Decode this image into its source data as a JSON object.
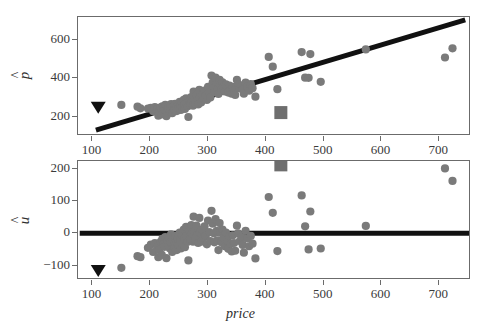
{
  "figure": {
    "width": 481,
    "height": 331,
    "background": "#ffffff",
    "point_color": "#7a7a7a",
    "line_color": "#111111",
    "frame_color": "#6b6b6b",
    "triangle_color": "#111111",
    "square_color": "#6e6e6e"
  },
  "chart_data": [
    {
      "type": "scatter",
      "id": "fitted-vs-price",
      "title": "",
      "xlabel": "price",
      "ylabel": "p̂",
      "xlim": [
        75,
        755
      ],
      "ylim": [
        100,
        720
      ],
      "grid": false,
      "legend": "none",
      "xticks": [
        100,
        200,
        300,
        400,
        500,
        600,
        700
      ],
      "yticks": [
        200,
        400,
        600
      ],
      "xticklabels": [
        "100",
        "200",
        "300",
        "400",
        "500",
        "600",
        "700"
      ],
      "yticklabels": [
        "200",
        "400",
        "600"
      ],
      "series": [
        {
          "name": "fitted values",
          "marker": "circle",
          "color": "#7a7a7a",
          "x": [
            150,
            178,
            183,
            196,
            201,
            205,
            208,
            212,
            214,
            216,
            218,
            220,
            221,
            223,
            225,
            226,
            228,
            229,
            231,
            232,
            234,
            235,
            236,
            238,
            239,
            241,
            242,
            243,
            245,
            246,
            248,
            249,
            251,
            252,
            253,
            255,
            256,
            258,
            259,
            260,
            262,
            263,
            265,
            266,
            268,
            269,
            271,
            272,
            274,
            275,
            277,
            278,
            280,
            281,
            283,
            285,
            286,
            288,
            290,
            292,
            294,
            296,
            298,
            300,
            302,
            304,
            306,
            308,
            310,
            311,
            313,
            315,
            316,
            318,
            320,
            321,
            323,
            325,
            327,
            329,
            331,
            333,
            335,
            337,
            339,
            341,
            343,
            345,
            347,
            350,
            352,
            355,
            358,
            360,
            362,
            365,
            368,
            371,
            374,
            377,
            382,
            405,
            412,
            420,
            462,
            468,
            474,
            477,
            495,
            573,
            710,
            723
          ],
          "y": [
            262,
            253,
            244,
            243,
            247,
            229,
            251,
            240,
            206,
            231,
            249,
            213,
            255,
            244,
            237,
            262,
            203,
            252,
            244,
            259,
            232,
            247,
            266,
            219,
            255,
            243,
            237,
            268,
            251,
            230,
            262,
            245,
            278,
            259,
            236,
            273,
            250,
            288,
            264,
            241,
            296,
            270,
            255,
            199,
            285,
            262,
            303,
            280,
            258,
            331,
            291,
            268,
            312,
            285,
            264,
            340,
            299,
            274,
            318,
            295,
            336,
            310,
            288,
            356,
            325,
            300,
            415,
            378,
            352,
            328,
            404,
            371,
            345,
            319,
            393,
            366,
            342,
            379,
            355,
            332,
            369,
            348,
            326,
            362,
            341,
            320,
            356,
            335,
            314,
            392,
            370,
            349,
            363,
            341,
            320,
            378,
            357,
            336,
            370,
            349,
            305,
            512,
            461,
            344,
            537,
            404,
            403,
            527,
            382,
            551,
            509,
            557
          ]
        }
      ],
      "special_markers": [
        {
          "name": "triangle-marker",
          "shape": "triangle-down",
          "x": 110,
          "y": 252,
          "color": "#111111"
        },
        {
          "name": "square-marker",
          "shape": "square",
          "x": 426,
          "y": 222,
          "color": "#6e6e6e"
        }
      ],
      "reference_line": {
        "name": "regression-line",
        "x1": 106,
        "y1": 131,
        "x2": 745,
        "y2": 705,
        "color": "#111111",
        "width": 5
      }
    },
    {
      "type": "scatter",
      "id": "residuals-vs-price",
      "title": "",
      "xlabel": "price",
      "ylabel": "û",
      "xlim": [
        75,
        755
      ],
      "ylim": [
        -145,
        225
      ],
      "grid": false,
      "legend": "none",
      "xticks": [
        100,
        200,
        300,
        400,
        500,
        600,
        700
      ],
      "yticks": [
        -100,
        0,
        100,
        200
      ],
      "xticklabels": [
        "100",
        "200",
        "300",
        "400",
        "500",
        "600",
        "700"
      ],
      "yticklabels": [
        "−100",
        "0",
        "100",
        "200"
      ],
      "series": [
        {
          "name": "residuals",
          "marker": "circle",
          "color": "#7a7a7a",
          "x": [
            150,
            178,
            183,
            196,
            201,
            205,
            208,
            212,
            214,
            216,
            218,
            220,
            221,
            223,
            225,
            226,
            228,
            229,
            231,
            232,
            234,
            235,
            236,
            238,
            239,
            241,
            242,
            243,
            245,
            246,
            248,
            249,
            251,
            252,
            253,
            255,
            256,
            258,
            259,
            260,
            262,
            263,
            265,
            266,
            268,
            269,
            271,
            272,
            274,
            275,
            277,
            278,
            280,
            281,
            283,
            285,
            286,
            288,
            290,
            292,
            294,
            296,
            298,
            300,
            302,
            304,
            306,
            308,
            310,
            311,
            313,
            315,
            316,
            318,
            320,
            321,
            323,
            325,
            327,
            329,
            331,
            333,
            335,
            337,
            339,
            341,
            343,
            345,
            347,
            350,
            352,
            355,
            358,
            360,
            362,
            365,
            368,
            371,
            374,
            377,
            382,
            405,
            412,
            420,
            462,
            468,
            474,
            477,
            495,
            573,
            710,
            723
          ],
          "y": [
            -107,
            -71,
            -74,
            -45,
            -35,
            -58,
            -30,
            -42,
            -74,
            -52,
            -26,
            -67,
            -17,
            -34,
            -42,
            -12,
            -77,
            -24,
            -36,
            -14,
            -47,
            -28,
            -3,
            -58,
            -18,
            -35,
            -44,
            -8,
            -27,
            -52,
            -16,
            -36,
            2,
            -20,
            -47,
            -4,
            -34,
            12,
            -16,
            -43,
            20,
            -8,
            -26,
            -84,
            8,
            -18,
            26,
            0,
            -26,
            52,
            6,
            -20,
            24,
            -6,
            -30,
            48,
            2,
            -26,
            12,
            -14,
            22,
            -8,
            -34,
            40,
            4,
            -24,
            70,
            30,
            0,
            -28,
            44,
            8,
            -22,
            -52,
            32,
            2,
            -28,
            12,
            -14,
            -40,
            2,
            -22,
            -48,
            -8,
            -32,
            -56,
            -6,
            -30,
            -54,
            24,
            0,
            -24,
            -12,
            -36,
            -60,
            8,
            -16,
            -40,
            -8,
            -32,
            -78,
            113,
            64,
            -55,
            118,
            22,
            -50,
            68,
            -47,
            23,
            202,
            163
          ]
        }
      ],
      "special_markers": [
        {
          "name": "triangle-marker",
          "shape": "triangle-down",
          "x": 110,
          "y": -114,
          "color": "#111111"
        },
        {
          "name": "square-marker",
          "shape": "square",
          "x": 426,
          "y": 213,
          "color": "#6e6e6e"
        }
      ],
      "reference_line": {
        "name": "zero-line",
        "x1": 78,
        "y1": 0,
        "x2": 752,
        "y2": 0,
        "color": "#111111",
        "width": 5
      }
    }
  ]
}
